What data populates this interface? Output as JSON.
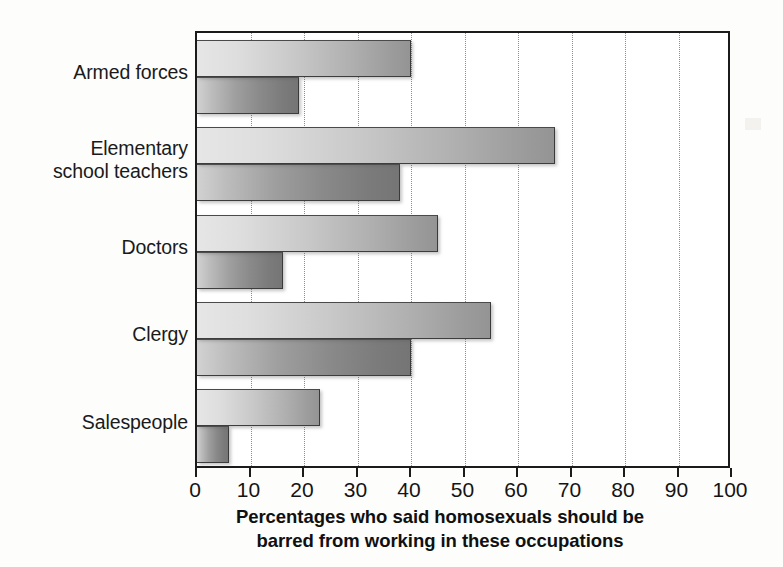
{
  "chart_data": {
    "type": "bar",
    "orientation": "horizontal",
    "title": "",
    "xlabel": "Percentages who said homosexuals should be barred from working in these occupations",
    "xlabel_line1": "Percentages who said homosexuals should be",
    "xlabel_line2": "barred from working in these occupations",
    "ylabel": "",
    "categories": [
      "Armed forces",
      "Elementary school teachers",
      "Doctors",
      "Clergy",
      "Salespeople"
    ],
    "category_lines": [
      [
        "Armed forces"
      ],
      [
        "Elementary",
        "school teachers"
      ],
      [
        "Doctors"
      ],
      [
        "Clergy"
      ],
      [
        "Salespeople"
      ]
    ],
    "series": [
      {
        "name": "1977",
        "color": "#a8a8a8",
        "values": [
          40,
          67,
          45,
          55,
          23
        ]
      },
      {
        "name": "2003",
        "color": "#787878",
        "values": [
          19,
          38,
          16,
          40,
          6
        ]
      }
    ],
    "xlim": [
      0,
      100
    ],
    "xticks": [
      0,
      10,
      20,
      30,
      40,
      50,
      60,
      70,
      80,
      90,
      100
    ],
    "xtick_labels": [
      "0",
      "10",
      "20",
      "30",
      "40",
      "50",
      "60",
      "70",
      "80",
      "90",
      "100"
    ],
    "grid": true,
    "grid_style": "dotted-vertical",
    "legend_position": "inside-lower-right",
    "legend_entries": [
      "1977",
      "2003"
    ]
  },
  "legend": {
    "items": [
      {
        "label": "1977",
        "swatch": "legend-swatch-1977"
      },
      {
        "label": "2003",
        "swatch": "legend-swatch-2003"
      }
    ]
  }
}
